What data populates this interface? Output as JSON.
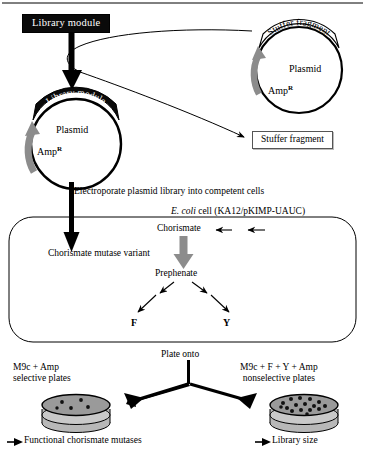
{
  "diagram": {
    "colors": {
      "ink": "#000000",
      "box_fill_black": "#0a0a0a",
      "box_text_white": "#ffffff",
      "gray_arrow": "#8c8c8c",
      "plate_fill": "#9a9a9a",
      "plate_rim": "#c9c9c9"
    }
  },
  "step1": {
    "library_module_box": "Library module",
    "stuffer_plasmid": {
      "band_label": "Stuffer fragment",
      "center_label": "Plasmid",
      "resistance_label": "Amp",
      "resistance_sup": "R"
    },
    "library_plasmid": {
      "band_label": "Library module",
      "center_label": "Plasmid",
      "resistance_label": "Amp",
      "resistance_sup": "R"
    },
    "stuffer_fragment_box": "Stuffer fragment"
  },
  "step2": {
    "electroporate_label": "Electroporate plasmid library into competent cells",
    "cell_label_italic": "E. coli",
    "cell_label_rest": " cell (KA12/pKIMP-UAUC)",
    "chorismate": "Chorismate",
    "mutase_variant": "Chorismate mutase variant",
    "prephenate": "Prephenate",
    "product_f": "F",
    "product_y": "Y"
  },
  "step3": {
    "plate_onto": "Plate onto",
    "left_plate_line1": "M9c + Amp",
    "left_plate_line2": "selective plates",
    "right_plate_line1": "M9c + F + Y + Amp",
    "right_plate_line2": "nonselective plates",
    "left_result": "Functional chorismate mutases",
    "right_result": "Library size",
    "left_colony_count": 5,
    "right_colony_count": 16
  }
}
